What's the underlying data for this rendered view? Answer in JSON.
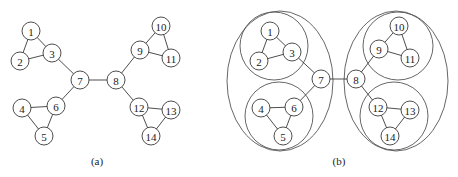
{
  "figure": {
    "width": 458,
    "height": 177,
    "node_radius": 9,
    "stroke_color": "#3a3a3a",
    "panels": [
      {
        "id": "a",
        "caption": "(a)",
        "caption_pos": [
          97,
          165
        ],
        "nodes": [
          {
            "id": "1",
            "x": 31,
            "y": 31
          },
          {
            "id": "2",
            "x": 20,
            "y": 61
          },
          {
            "id": "3",
            "x": 52,
            "y": 53
          },
          {
            "id": "4",
            "x": 22,
            "y": 108
          },
          {
            "id": "5",
            "x": 44,
            "y": 136
          },
          {
            "id": "6",
            "x": 56,
            "y": 106
          },
          {
            "id": "7",
            "x": 80,
            "y": 80
          },
          {
            "id": "8",
            "x": 116,
            "y": 80
          },
          {
            "id": "9",
            "x": 140,
            "y": 50
          },
          {
            "id": "10",
            "x": 161,
            "y": 26
          },
          {
            "id": "11",
            "x": 171,
            "y": 58
          },
          {
            "id": "12",
            "x": 139,
            "y": 107
          },
          {
            "id": "13",
            "x": 171,
            "y": 110
          },
          {
            "id": "14",
            "x": 151,
            "y": 136
          }
        ],
        "edges": [
          [
            "1",
            "2"
          ],
          [
            "1",
            "3"
          ],
          [
            "2",
            "3"
          ],
          [
            "3",
            "7"
          ],
          [
            "4",
            "6"
          ],
          [
            "4",
            "5"
          ],
          [
            "5",
            "6"
          ],
          [
            "6",
            "7"
          ],
          [
            "7",
            "8"
          ],
          [
            "8",
            "9"
          ],
          [
            "9",
            "10"
          ],
          [
            "9",
            "11"
          ],
          [
            "10",
            "11"
          ],
          [
            "8",
            "12"
          ],
          [
            "12",
            "13"
          ],
          [
            "12",
            "14"
          ],
          [
            "13",
            "14"
          ]
        ],
        "groups": []
      },
      {
        "id": "b",
        "caption": "(b)",
        "caption_pos": [
          339,
          165
        ],
        "nodes": [
          {
            "id": "1",
            "x": 270,
            "y": 31
          },
          {
            "id": "2",
            "x": 259,
            "y": 61
          },
          {
            "id": "3",
            "x": 292,
            "y": 52
          },
          {
            "id": "4",
            "x": 261,
            "y": 108
          },
          {
            "id": "5",
            "x": 283,
            "y": 136
          },
          {
            "id": "6",
            "x": 294,
            "y": 107
          },
          {
            "id": "7",
            "x": 321,
            "y": 79
          },
          {
            "id": "8",
            "x": 356,
            "y": 79
          },
          {
            "id": "9",
            "x": 379,
            "y": 49
          },
          {
            "id": "10",
            "x": 399,
            "y": 26
          },
          {
            "id": "11",
            "x": 410,
            "y": 58
          },
          {
            "id": "12",
            "x": 378,
            "y": 107
          },
          {
            "id": "13",
            "x": 410,
            "y": 110
          },
          {
            "id": "14",
            "x": 390,
            "y": 136
          }
        ],
        "edges": [
          [
            "1",
            "2"
          ],
          [
            "1",
            "3"
          ],
          [
            "2",
            "3"
          ],
          [
            "3",
            "7"
          ],
          [
            "4",
            "6"
          ],
          [
            "4",
            "5"
          ],
          [
            "5",
            "6"
          ],
          [
            "6",
            "7"
          ],
          [
            "7",
            "8"
          ],
          [
            "8",
            "9"
          ],
          [
            "9",
            "10"
          ],
          [
            "9",
            "11"
          ],
          [
            "10",
            "11"
          ],
          [
            "8",
            "12"
          ],
          [
            "12",
            "13"
          ],
          [
            "12",
            "14"
          ],
          [
            "13",
            "14"
          ]
        ],
        "groups": [
          {
            "name": "outer-left",
            "cx": 280,
            "cy": 81,
            "rx": 53,
            "ry": 70,
            "members": [
              "1",
              "2",
              "3",
              "4",
              "5",
              "6",
              "7"
            ]
          },
          {
            "name": "outer-right",
            "cx": 396,
            "cy": 81,
            "rx": 52,
            "ry": 70,
            "members": [
              "8",
              "9",
              "10",
              "11",
              "12",
              "13",
              "14"
            ]
          },
          {
            "name": "inner-1-2-3",
            "cx": 274,
            "cy": 46,
            "rx": 34,
            "ry": 34,
            "members": [
              "1",
              "2",
              "3"
            ]
          },
          {
            "name": "inner-4-5-6",
            "cx": 279,
            "cy": 116,
            "rx": 34,
            "ry": 34,
            "members": [
              "4",
              "5",
              "6"
            ]
          },
          {
            "name": "inner-9-10-11",
            "cx": 398,
            "cy": 46,
            "rx": 35,
            "ry": 34,
            "members": [
              "9",
              "10",
              "11"
            ]
          },
          {
            "name": "inner-12-13-14",
            "cx": 394,
            "cy": 116,
            "rx": 34,
            "ry": 34,
            "members": [
              "12",
              "13",
              "14"
            ]
          }
        ]
      }
    ]
  }
}
